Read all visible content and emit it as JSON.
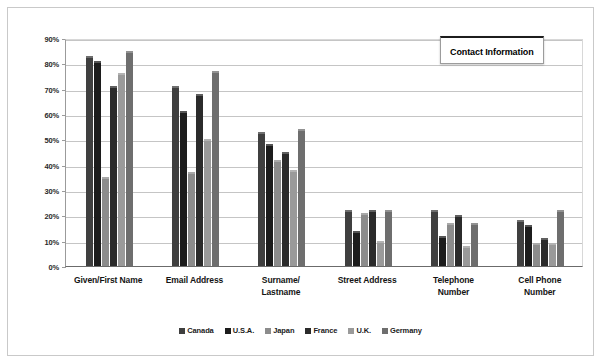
{
  "title": "Contact Information",
  "chart_data": {
    "type": "bar",
    "title": "Contact Information",
    "xlabel": "",
    "ylabel": "",
    "ylim": [
      0,
      90
    ],
    "ytick_labels": [
      "90%",
      "80%",
      "70%",
      "60%",
      "50%",
      "40%",
      "30%",
      "20%",
      "10%",
      "0%"
    ],
    "ytick_values": [
      90,
      80,
      70,
      60,
      50,
      40,
      30,
      20,
      10,
      0
    ],
    "grid": true,
    "legend_position": "bottom",
    "categories": [
      "Given/First Name",
      "Email Address",
      "Surname/\nLastname",
      "Street Address",
      "Telephone\nNumber",
      "Cell Phone\nNumber"
    ],
    "category_lines": [
      [
        "Given/First Name"
      ],
      [
        "Email Address"
      ],
      [
        "Surname/",
        "Lastname"
      ],
      [
        "Street Address"
      ],
      [
        "Telephone",
        "Number"
      ],
      [
        "Cell Phone",
        "Number"
      ]
    ],
    "series": [
      {
        "name": "Canada",
        "color": "#3f3f3f",
        "values": [
          83,
          71,
          53,
          22,
          22,
          18
        ]
      },
      {
        "name": "U.S.A.",
        "color": "#1c1c1c",
        "values": [
          81,
          61,
          48,
          14,
          12,
          16
        ]
      },
      {
        "name": "Japan",
        "color": "#8c8c8c",
        "values": [
          35,
          37,
          42,
          21,
          17,
          9
        ]
      },
      {
        "name": "France",
        "color": "#2b2b2b",
        "values": [
          71,
          68,
          45,
          22,
          20,
          11
        ]
      },
      {
        "name": "U.K.",
        "color": "#9a9a9a",
        "values": [
          76,
          50,
          38,
          10,
          8,
          9
        ]
      },
      {
        "name": "Germany",
        "color": "#6e6e6e",
        "values": [
          85,
          77,
          54,
          22,
          17,
          22
        ]
      }
    ]
  },
  "legend": {
    "items": [
      {
        "label": "Canada",
        "color": "#3f3f3f"
      },
      {
        "label": "U.S.A.",
        "color": "#1c1c1c"
      },
      {
        "label": "Japan",
        "color": "#8c8c8c"
      },
      {
        "label": "France",
        "color": "#2b2b2b"
      },
      {
        "label": "U.K.",
        "color": "#9a9a9a"
      },
      {
        "label": "Germany",
        "color": "#6e6e6e"
      }
    ]
  }
}
